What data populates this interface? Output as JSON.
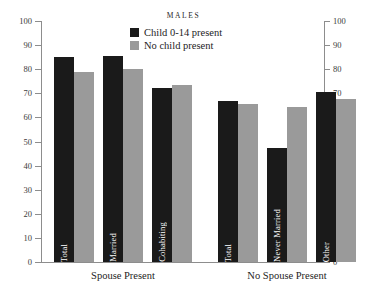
{
  "chart_data": {
    "type": "bar",
    "title": "MALES",
    "xlabel": "",
    "ylabel": "",
    "ylim": [
      0,
      100
    ],
    "ytick_labels": [
      "100",
      "90",
      "80",
      "70",
      "60",
      "50",
      "40",
      "30",
      "20",
      "10",
      "0"
    ],
    "ytick_values": [
      100,
      90,
      80,
      70,
      60,
      50,
      40,
      30,
      20,
      10,
      0
    ],
    "grid": false,
    "legend_position": "top-center",
    "left_axis_labels": [
      "100",
      "90",
      "80",
      "70",
      "60",
      "50",
      "40",
      "30",
      "20",
      "10",
      "0"
    ],
    "right_axis_labels": [
      "100",
      "90",
      "80",
      "70",
      "60",
      "50",
      "40",
      "30",
      "20",
      "10",
      "0"
    ],
    "categories": [
      "Total",
      "Married",
      "Cohabiting",
      "Total",
      "Never Married",
      "Other"
    ],
    "groups": [
      {
        "label": "Spouse Present",
        "categories": [
          "Total",
          "Married",
          "Cohabiting"
        ]
      },
      {
        "label": "No Spouse Present",
        "categories": [
          "Total",
          "Never Married",
          "Other"
        ]
      }
    ],
    "series": [
      {
        "name": "Child 0-14 present",
        "color": "#1a1a1a",
        "values": [
          85,
          85.5,
          72,
          67,
          47.5,
          70.5
        ]
      },
      {
        "name": "No child present",
        "color": "#9a9a9a",
        "values": [
          79,
          80,
          73.5,
          65.5,
          64.5,
          67.5
        ]
      }
    ]
  },
  "legend": {
    "items": [
      {
        "label": "Child 0-14 present",
        "color": "#1a1a1a"
      },
      {
        "label": "No child present",
        "color": "#9a9a9a"
      }
    ]
  }
}
